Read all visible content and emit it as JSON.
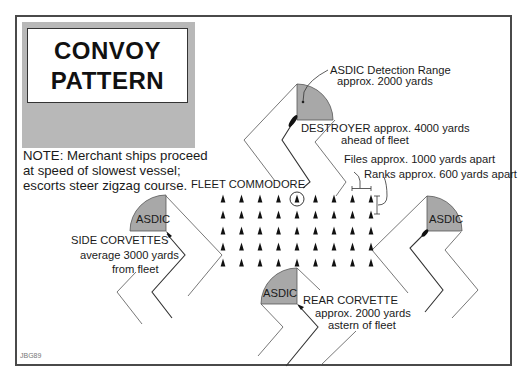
{
  "title": {
    "line1": "CONVOY",
    "line2": "PATTERN"
  },
  "note": {
    "line1": "NOTE: Merchant ships proceed",
    "line2": "at speed of slowest vessel;",
    "line3": "escorts steer zigzag course."
  },
  "labels": {
    "asdic_range_line1": "ASDIC Detection Range",
    "asdic_range_line2": "approx. 2000 yards",
    "destroyer_line1": "DESTROYER approx. 4000 yards",
    "destroyer_line2": "ahead of fleet",
    "files": "Files approx. 1000 yards apart",
    "ranks": "Ranks approx. 600 yards apart",
    "fleet_commodore": "FLEET COMMODORE",
    "side_corvettes_line1": "SIDE CORVETTES",
    "side_corvettes_line2": "average 3000 yards",
    "side_corvettes_line3": "from fleet",
    "rear_corvette_line1": "REAR CORVETTE",
    "rear_corvette_line2": "approx. 2000 yards",
    "rear_corvette_line3": "astern of fleet",
    "asdic": "ASDIC",
    "credit": "JBG89"
  },
  "fleet": {
    "columns": 9,
    "rows": 5,
    "commodore_position": {
      "row": 1,
      "column": 5
    }
  },
  "colors": {
    "asdic_fill": "#a8a8a8",
    "panel_grey": "#b8b8b8",
    "border": "#4a4a4a"
  }
}
